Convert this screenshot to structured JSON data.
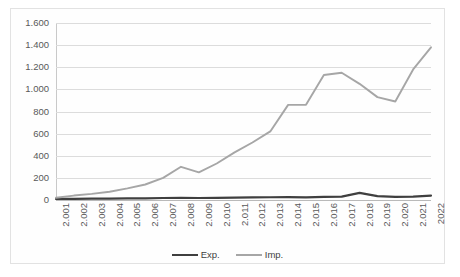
{
  "chart_data": {
    "type": "line",
    "title": "",
    "subtitle": "",
    "xlabel": "",
    "ylabel": "",
    "grid": true,
    "legend_position": "bottom",
    "ylim": [
      0,
      1600
    ],
    "yticks": [
      0,
      200,
      400,
      600,
      800,
      1000,
      1200,
      1400,
      1600
    ],
    "ytick_labels": [
      "0",
      "200",
      "400",
      "600",
      "800",
      "1.000",
      "1.200",
      "1.400",
      "1.600"
    ],
    "categories": [
      "2.001",
      "2.002",
      "2.003",
      "2.004",
      "2.005",
      "2.006",
      "2.007",
      "2.008",
      "2.009",
      "2.010",
      "2.011",
      "2.012",
      "2.013",
      "2.014",
      "2.015",
      "2.016",
      "2.017",
      "2.018",
      "2.019",
      "2.020",
      "2.021",
      "2022"
    ],
    "series": [
      {
        "name": "Exp.",
        "color": "#3f3f3f",
        "values": [
          10,
          10,
          12,
          12,
          14,
          15,
          18,
          20,
          18,
          20,
          22,
          24,
          25,
          26,
          24,
          28,
          30,
          65,
          35,
          28,
          30,
          40
        ]
      },
      {
        "name": "Imp.",
        "color": "#a6a6a6",
        "values": [
          20,
          40,
          55,
          75,
          105,
          140,
          200,
          300,
          250,
          330,
          430,
          520,
          620,
          860,
          860,
          1130,
          1150,
          1050,
          930,
          890,
          1180,
          1380
        ]
      }
    ]
  },
  "legend": {
    "items": [
      {
        "label": "Exp."
      },
      {
        "label": "Imp."
      }
    ]
  },
  "colors": {
    "exp_line": "#3f3f3f",
    "imp_line": "#a6a6a6",
    "gridline": "#dcdcdc",
    "axis": "#c9c9c9",
    "tick_text": "#595959",
    "card_border": "#e2e2e2",
    "background": "#ffffff"
  }
}
